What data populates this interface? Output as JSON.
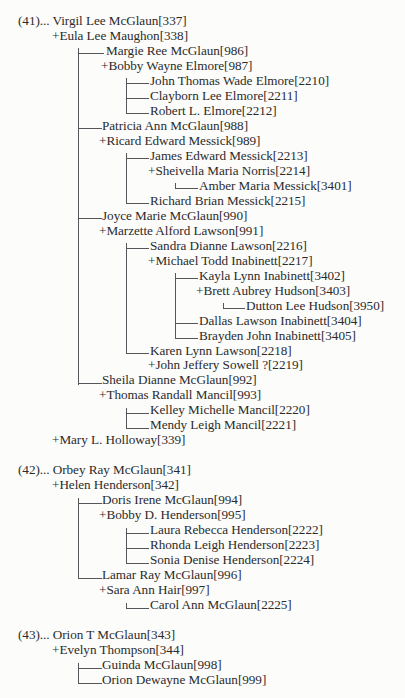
{
  "document": {
    "type": "descendant-genealogy-chart",
    "page_background": "#fcfcfb",
    "text_color": "#2b2b2b",
    "line_color": "#55555a"
  },
  "generations": [
    {
      "number": "(41)...",
      "root": "Virgil Lee McGlaun[337]"
    },
    {
      "number": "(42)...",
      "root": "Orbey Ray McGlaun[341]"
    },
    {
      "number": "(43)...",
      "root": "Orion T McGlaun[343]"
    }
  ],
  "rows": [
    {
      "id": "r0",
      "text": "(41)... Virgil Lee McGlaun[337]",
      "x": 18,
      "y": 28,
      "kind": "generation-head",
      "person": "Virgil Lee McGlaun",
      "ref": "337"
    },
    {
      "id": "r1",
      "text": "+Eula Lee Maughon[338]",
      "x": 52,
      "y": 46,
      "kind": "spouse",
      "person": "Eula Lee Maughon",
      "ref": "338"
    },
    {
      "id": "r2",
      "text": "Margie Ree McGlaun[986]",
      "x": 106,
      "y": 64,
      "kind": "child",
      "person": "Margie Ree McGlaun",
      "ref": "986"
    },
    {
      "id": "r3",
      "text": "+Bobby Wayne Elmore[987]",
      "x": 101,
      "y": 82,
      "kind": "spouse",
      "person": "Bobby Wayne Elmore",
      "ref": "987"
    },
    {
      "id": "r4",
      "text": "John Thomas Wade Elmore[2210]",
      "x": 150,
      "y": 100,
      "kind": "child",
      "person": "John Thomas Wade Elmore",
      "ref": "2210"
    },
    {
      "id": "r5",
      "text": "Clayborn Lee Elmore[2211]",
      "x": 150,
      "y": 118,
      "kind": "child",
      "person": "Clayborn Lee Elmore",
      "ref": "2211"
    },
    {
      "id": "r6",
      "text": "Robert L. Elmore[2212]",
      "x": 150,
      "y": 136,
      "kind": "child-last",
      "person": "Robert L. Elmore",
      "ref": "2212"
    },
    {
      "id": "r7",
      "text": "Patricia Ann McGlaun[988]",
      "x": 102,
      "y": 154,
      "kind": "child",
      "person": "Patricia Ann McGlaun",
      "ref": "988"
    },
    {
      "id": "r8",
      "text": "+Ricard Edward Messick[989]",
      "x": 99,
      "y": 172,
      "kind": "spouse",
      "person": "Ricard Edward Messick",
      "ref": "989"
    },
    {
      "id": "r9",
      "text": "James Edward Messick[2213]",
      "x": 150,
      "y": 190,
      "kind": "child",
      "person": "James Edward Messick",
      "ref": "2213"
    },
    {
      "id": "r10",
      "text": "+Sheivella Maria Norris[2214]",
      "x": 148,
      "y": 208,
      "kind": "spouse",
      "person": "Sheivella Maria Norris",
      "ref": "2214"
    },
    {
      "id": "r11",
      "text": "Amber Maria Messick[3401]",
      "x": 199,
      "y": 226,
      "kind": "child-last",
      "person": "Amber Maria Messick",
      "ref": "3401"
    },
    {
      "id": "r12",
      "text": "Richard Brian Messick[2215]",
      "x": 150,
      "y": 244,
      "kind": "child-last",
      "person": "Richard Brian Messick",
      "ref": "2215"
    },
    {
      "id": "r13",
      "text": "Joyce Marie McGlaun[990]",
      "x": 102,
      "y": 262,
      "kind": "child",
      "person": "Joyce Marie McGlaun",
      "ref": "990"
    },
    {
      "id": "r14",
      "text": "+Marzette Alford Lawson[991]",
      "x": 99,
      "y": 280,
      "kind": "spouse",
      "person": "Marzette Alford Lawson",
      "ref": "991"
    },
    {
      "id": "r15",
      "text": "Sandra Dianne Lawson[2216]",
      "x": 150,
      "y": 298,
      "kind": "child",
      "person": "Sandra Dianne Lawson",
      "ref": "2216"
    },
    {
      "id": "r16",
      "text": "+Michael Todd Inabinett[2217]",
      "x": 148,
      "y": 316,
      "kind": "spouse",
      "person": "Michael Todd Inabinett",
      "ref": "2217"
    },
    {
      "id": "r17",
      "text": "Kayla Lynn Inabinett[3402]",
      "x": 199,
      "y": 334,
      "kind": "child",
      "person": "Kayla Lynn Inabinett",
      "ref": "3402"
    },
    {
      "id": "r18",
      "text": "+Brett Aubrey Hudson[3403]",
      "x": 196,
      "y": 352,
      "kind": "spouse",
      "person": "Brett Aubrey Hudson",
      "ref": "3403"
    },
    {
      "id": "r19",
      "text": "Dutton Lee Hudson[3950]",
      "x": 246,
      "y": 370,
      "kind": "child-last",
      "person": "Dutton Lee Hudson",
      "ref": "3950"
    },
    {
      "id": "r20",
      "text": "Dallas Lawson Inabinett[3404]",
      "x": 199,
      "y": 388,
      "kind": "child",
      "person": "Dallas Lawson Inabinett",
      "ref": "3404"
    },
    {
      "id": "r21",
      "text": "Brayden John Inabinett[3405]",
      "x": 199,
      "y": 406,
      "kind": "child-last",
      "person": "Brayden John Inabinett",
      "ref": "3405"
    },
    {
      "id": "r22",
      "text": "Karen Lynn Lawson[2218]",
      "x": 150,
      "y": 424,
      "kind": "child-last",
      "person": "Karen Lynn Lawson",
      "ref": "2218"
    },
    {
      "id": "r23",
      "text": "+John Jeffery Sowell ?[2219]",
      "x": 148,
      "y": 442,
      "kind": "spouse",
      "person": "John Jeffery Sowell ?",
      "ref": "2219"
    },
    {
      "id": "r24",
      "text": "Sheila Dianne McGlaun[992]",
      "x": 102,
      "y": 460,
      "kind": "child-last",
      "person": "Sheila Dianne McGlaun",
      "ref": "992"
    },
    {
      "id": "r25",
      "text": "+Thomas Randall Mancil[993]",
      "x": 99,
      "y": 478,
      "kind": "spouse",
      "person": "Thomas Randall Mancil",
      "ref": "993"
    },
    {
      "id": "r26",
      "text": "Kelley Michelle Mancil[2220]",
      "x": 150,
      "y": 496,
      "kind": "child",
      "person": "Kelley Michelle Mancil",
      "ref": "2220"
    },
    {
      "id": "r27",
      "text": "Mendy Leigh Mancil[2221]",
      "x": 150,
      "y": 514,
      "kind": "child-last",
      "person": "Mendy Leigh Mancil",
      "ref": "2221"
    },
    {
      "id": "r28",
      "text": "+Mary L. Holloway[339]",
      "x": 52,
      "y": 532,
      "kind": "spouse",
      "person": "Mary L. Holloway",
      "ref": "339"
    },
    {
      "id": "r29",
      "text": "(42)... Orbey Ray McGlaun[341]",
      "x": 18,
      "y": 568,
      "kind": "generation-head",
      "person": "Orbey Ray McGlaun",
      "ref": "341"
    },
    {
      "id": "r30",
      "text": "+Helen Henderson[342]",
      "x": 52,
      "y": 586,
      "kind": "spouse",
      "person": "Helen Henderson",
      "ref": "342"
    },
    {
      "id": "r31",
      "text": "Doris Irene McGlaun[994]",
      "x": 102,
      "y": 604,
      "kind": "child",
      "person": "Doris Irene McGlaun",
      "ref": "994"
    },
    {
      "id": "r32",
      "text": "+Bobby D. Henderson[995]",
      "x": 99,
      "y": 622,
      "kind": "spouse",
      "person": "Bobby D. Henderson",
      "ref": "995"
    },
    {
      "id": "r33",
      "text": "Laura Rebecca Henderson[2222]",
      "x": 150,
      "y": 640,
      "kind": "child",
      "person": "Laura Rebecca Henderson",
      "ref": "2222"
    },
    {
      "id": "r34",
      "text": "Rhonda Leigh Henderson[2223]",
      "x": 150,
      "y": 658,
      "kind": "child",
      "person": "Rhonda Leigh Henderson",
      "ref": "2223"
    },
    {
      "id": "r35",
      "text": "Sonia Denise Henderson[2224]",
      "x": 150,
      "y": 676,
      "kind": "child-last",
      "person": "Sonia Denise Henderson",
      "ref": "2224"
    },
    {
      "id": "r36",
      "text": "Lamar Ray McGlaun[996]",
      "x": 102,
      "y": 694,
      "kind": "child-last",
      "person": "Lamar Ray McGlaun",
      "ref": "996"
    },
    {
      "id": "r37",
      "text": "+Sara Ann Hair[997]",
      "x": 99,
      "y": 712,
      "kind": "spouse",
      "person": "Sara Ann Hair",
      "ref": "997"
    },
    {
      "id": "r38",
      "text": "Carol Ann McGlaun[2225]",
      "x": 150,
      "y": 730,
      "kind": "child-last",
      "person": "Carol Ann McGlaun",
      "ref": "2225"
    },
    {
      "id": "r39",
      "text": "(43)... Orion T McGlaun[343]",
      "x": 18,
      "y": 766,
      "kind": "generation-head",
      "person": "Orion T McGlaun",
      "ref": "343"
    },
    {
      "id": "r40",
      "text": "+Evelyn Thompson[344]",
      "x": 52,
      "y": 784,
      "kind": "spouse",
      "person": "Evelyn Thompson",
      "ref": "344"
    },
    {
      "id": "r41",
      "text": "Guinda McGlaun[998]",
      "x": 102,
      "y": 802,
      "kind": "child",
      "person": "Guinda McGlaun",
      "ref": "998"
    },
    {
      "id": "r42",
      "text": "Orion Dewayne McGlaun[999]",
      "x": 102,
      "y": 820,
      "kind": "child-last",
      "person": "Orion Dewayne McGlaun",
      "ref": "999"
    }
  ],
  "connectors": [
    {
      "id": "c0",
      "orient": "v",
      "x": 78,
      "y": 58,
      "len": 404
    },
    {
      "id": "c1",
      "orient": "h",
      "x": 78,
      "y": 64,
      "len": 26
    },
    {
      "id": "c2",
      "orient": "h",
      "x": 78,
      "y": 154,
      "len": 24
    },
    {
      "id": "c3",
      "orient": "h",
      "x": 78,
      "y": 262,
      "len": 24
    },
    {
      "id": "c4",
      "orient": "h",
      "x": 78,
      "y": 460,
      "len": 24
    },
    {
      "id": "c5",
      "orient": "v",
      "x": 126,
      "y": 94,
      "len": 43
    },
    {
      "id": "c6",
      "orient": "h",
      "x": 126,
      "y": 100,
      "len": 23
    },
    {
      "id": "c7",
      "orient": "h",
      "x": 126,
      "y": 118,
      "len": 23
    },
    {
      "id": "c8",
      "orient": "h",
      "x": 126,
      "y": 136,
      "len": 23
    },
    {
      "id": "c9",
      "orient": "v",
      "x": 126,
      "y": 184,
      "len": 61
    },
    {
      "id": "c10",
      "orient": "h",
      "x": 126,
      "y": 190,
      "len": 23
    },
    {
      "id": "c11",
      "orient": "h",
      "x": 126,
      "y": 244,
      "len": 23
    },
    {
      "id": "c12",
      "orient": "v",
      "x": 175,
      "y": 220,
      "len": 7
    },
    {
      "id": "c13",
      "orient": "h",
      "x": 175,
      "y": 226,
      "len": 23
    },
    {
      "id": "c14",
      "orient": "v",
      "x": 126,
      "y": 292,
      "len": 133
    },
    {
      "id": "c15",
      "orient": "h",
      "x": 126,
      "y": 298,
      "len": 23
    },
    {
      "id": "c16",
      "orient": "h",
      "x": 126,
      "y": 424,
      "len": 23
    },
    {
      "id": "c17",
      "orient": "v",
      "x": 175,
      "y": 328,
      "len": 79
    },
    {
      "id": "c18",
      "orient": "h",
      "x": 175,
      "y": 334,
      "len": 23
    },
    {
      "id": "c19",
      "orient": "h",
      "x": 175,
      "y": 388,
      "len": 23
    },
    {
      "id": "c20",
      "orient": "h",
      "x": 175,
      "y": 406,
      "len": 23
    },
    {
      "id": "c21",
      "orient": "v",
      "x": 223,
      "y": 364,
      "len": 7
    },
    {
      "id": "c22",
      "orient": "h",
      "x": 223,
      "y": 370,
      "len": 22
    },
    {
      "id": "c23",
      "orient": "v",
      "x": 126,
      "y": 490,
      "len": 25
    },
    {
      "id": "c24",
      "orient": "h",
      "x": 126,
      "y": 496,
      "len": 23
    },
    {
      "id": "c25",
      "orient": "h",
      "x": 126,
      "y": 514,
      "len": 23
    },
    {
      "id": "c26",
      "orient": "v",
      "x": 78,
      "y": 598,
      "len": 97
    },
    {
      "id": "c27",
      "orient": "h",
      "x": 78,
      "y": 604,
      "len": 24
    },
    {
      "id": "c28",
      "orient": "h",
      "x": 78,
      "y": 694,
      "len": 24
    },
    {
      "id": "c29",
      "orient": "v",
      "x": 126,
      "y": 634,
      "len": 43
    },
    {
      "id": "c30",
      "orient": "h",
      "x": 126,
      "y": 640,
      "len": 23
    },
    {
      "id": "c31",
      "orient": "h",
      "x": 126,
      "y": 658,
      "len": 23
    },
    {
      "id": "c32",
      "orient": "h",
      "x": 126,
      "y": 676,
      "len": 23
    },
    {
      "id": "c33",
      "orient": "v",
      "x": 126,
      "y": 724,
      "len": 7
    },
    {
      "id": "c34",
      "orient": "h",
      "x": 126,
      "y": 730,
      "len": 23
    },
    {
      "id": "c35",
      "orient": "v",
      "x": 78,
      "y": 796,
      "len": 25
    },
    {
      "id": "c36",
      "orient": "h",
      "x": 78,
      "y": 802,
      "len": 24
    },
    {
      "id": "c37",
      "orient": "h",
      "x": 78,
      "y": 820,
      "len": 24
    }
  ]
}
